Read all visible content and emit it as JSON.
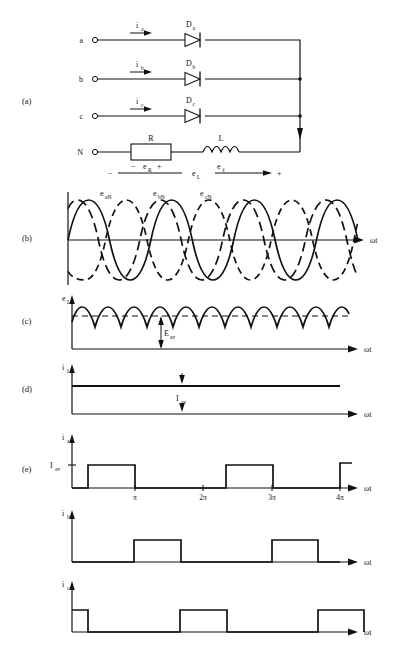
{
  "figure": {
    "panel_labels": [
      "(a)",
      "(b)",
      "(c)",
      "(d)",
      "(e)"
    ]
  },
  "circuit": {
    "terminals": [
      {
        "name": "a",
        "label": "a"
      },
      {
        "name": "b",
        "label": "b"
      },
      {
        "name": "c",
        "label": "c"
      },
      {
        "name": "N",
        "label": "N"
      }
    ],
    "currents": [
      {
        "label": "i",
        "sub": "a"
      },
      {
        "label": "i",
        "sub": "b"
      },
      {
        "label": "i",
        "sub": "c"
      }
    ],
    "diodes": [
      {
        "label": "D",
        "sub": "a"
      },
      {
        "label": "D",
        "sub": "b"
      },
      {
        "label": "D",
        "sub": "c"
      }
    ],
    "resistor": {
      "label": "R",
      "voltage": "e",
      "voltage_sub": "R",
      "polarity_left": "−",
      "polarity_right": "+"
    },
    "inductor": {
      "label": "L",
      "voltage": "e",
      "voltage_sub": "ℓ"
    },
    "load_voltage": {
      "label": "e",
      "sub": "L",
      "minus": "−",
      "plus": "+"
    }
  },
  "panel_b": {
    "axis_label": "ωt",
    "series": [
      {
        "name": "e",
        "sub": "aN",
        "style": "solid"
      },
      {
        "name": "e",
        "sub": "bN",
        "style": "dashed"
      },
      {
        "name": "e",
        "sub": "cN",
        "style": "dashed-long"
      }
    ]
  },
  "panel_c": {
    "y_label": "e",
    "y_label_sub": "L",
    "axis_label": "ωt",
    "average_label": "E",
    "average_sub": "av"
  },
  "panel_d": {
    "y_label": "i",
    "y_label_sub": "L",
    "axis_label": "ωt",
    "average_label": "I",
    "average_sub": "av"
  },
  "panel_e": {
    "axis_label": "ωt",
    "level_label": "I",
    "level_sub": "av",
    "x_ticks": [
      "π",
      "2π",
      "3π",
      "4π"
    ],
    "traces": [
      {
        "name": "i",
        "sub": "a"
      },
      {
        "name": "i",
        "sub": "b"
      },
      {
        "name": "i",
        "sub": "c"
      }
    ]
  },
  "colors": {
    "ink": "#111111",
    "paper": "#ffffff"
  }
}
